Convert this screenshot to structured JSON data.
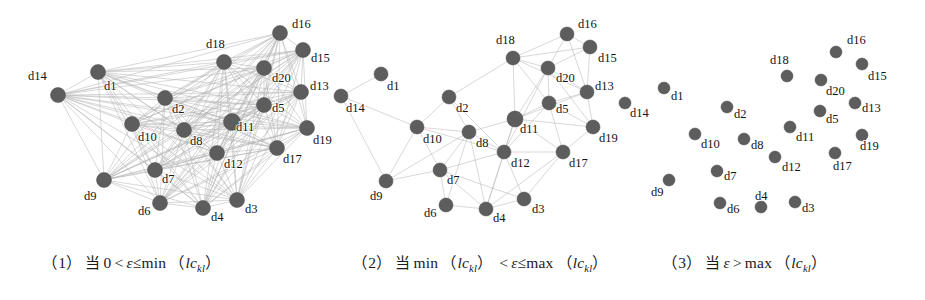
{
  "figure": {
    "node_color": "#5d5d5d",
    "edge_color": "#b2b2b2",
    "background": "#ffffff",
    "node_labels": [
      "d1",
      "d2",
      "d3",
      "d4",
      "d5",
      "d6",
      "d7",
      "d8",
      "d9",
      "d10",
      "d11",
      "d12",
      "d13",
      "d14",
      "d15",
      "d16",
      "d17",
      "d18",
      "d19",
      "d20"
    ]
  },
  "panels": [
    {
      "id": "panel-1",
      "caption": {
        "index": "（1）",
        "cjk": "当",
        "expr_left": "0",
        "rel1": "<",
        "var": "ε",
        "rel2": "≤",
        "fn": "min",
        "arg_open": "（",
        "arg_base": "lc",
        "arg_sub": "kl",
        "arg_close": "）"
      },
      "density": "full",
      "nodes": [
        {
          "label": "d14",
          "x": 58,
          "y": 95,
          "r": 7.5,
          "lx": 28,
          "ly": 80
        },
        {
          "label": "d1",
          "x": 98,
          "y": 72,
          "r": 7.5,
          "lx": 104,
          "ly": 90
        },
        {
          "label": "d18",
          "x": 224,
          "y": 62,
          "r": 7.5,
          "lx": 206,
          "ly": 48
        },
        {
          "label": "d16",
          "x": 280,
          "y": 33,
          "r": 7.5,
          "lx": 292,
          "ly": 28
        },
        {
          "label": "d15",
          "x": 303,
          "y": 50,
          "r": 7.5,
          "lx": 311,
          "ly": 62
        },
        {
          "label": "d20",
          "x": 264,
          "y": 68,
          "r": 7.5,
          "lx": 272,
          "ly": 82
        },
        {
          "label": "d13",
          "x": 301,
          "y": 92,
          "r": 7.5,
          "lx": 310,
          "ly": 90
        },
        {
          "label": "d2",
          "x": 165,
          "y": 98,
          "r": 7.5,
          "lx": 172,
          "ly": 113
        },
        {
          "label": "d5",
          "x": 264,
          "y": 105,
          "r": 7.5,
          "lx": 272,
          "ly": 112
        },
        {
          "label": "d19",
          "x": 307,
          "y": 128,
          "r": 7.5,
          "lx": 313,
          "ly": 144
        },
        {
          "label": "d10",
          "x": 132,
          "y": 124,
          "r": 7.5,
          "lx": 138,
          "ly": 141
        },
        {
          "label": "d8",
          "x": 184,
          "y": 130,
          "r": 7.5,
          "lx": 190,
          "ly": 145
        },
        {
          "label": "d11",
          "x": 232,
          "y": 122,
          "r": 8.5,
          "lx": 236,
          "ly": 131
        },
        {
          "label": "d12",
          "x": 217,
          "y": 153,
          "r": 7.5,
          "lx": 224,
          "ly": 168
        },
        {
          "label": "d17",
          "x": 277,
          "y": 148,
          "r": 7.5,
          "lx": 283,
          "ly": 163
        },
        {
          "label": "d7",
          "x": 155,
          "y": 170,
          "r": 7.5,
          "lx": 162,
          "ly": 183
        },
        {
          "label": "d9",
          "x": 104,
          "y": 180,
          "r": 7.5,
          "lx": 84,
          "ly": 200
        },
        {
          "label": "d6",
          "x": 160,
          "y": 203,
          "r": 7.5,
          "lx": 138,
          "ly": 215
        },
        {
          "label": "d4",
          "x": 203,
          "y": 208,
          "r": 7.5,
          "lx": 211,
          "ly": 221
        },
        {
          "label": "d3",
          "x": 237,
          "y": 200,
          "r": 7.5,
          "lx": 245,
          "ly": 213
        }
      ]
    },
    {
      "id": "panel-2",
      "caption": {
        "index": "（2）",
        "cjk": "当",
        "fn1": "min",
        "arg1_open": "（",
        "arg1_base": "lc",
        "arg1_sub": "kl",
        "arg1_close": "）",
        "rel1": "<",
        "var": "ε",
        "rel2": "≤",
        "fn2": "max",
        "arg2_open": "（",
        "arg2_base": "lc",
        "arg2_sub": "kl",
        "arg2_close": "）"
      },
      "density": "sparse",
      "nodes": [
        {
          "label": "d14",
          "x": 11,
          "y": 96,
          "r": 7,
          "lx": 16,
          "ly": 112
        },
        {
          "label": "d1",
          "x": 51,
          "y": 74,
          "r": 7,
          "lx": 57,
          "ly": 90
        },
        {
          "label": "d18",
          "x": 183,
          "y": 58,
          "r": 7,
          "lx": 166,
          "ly": 44
        },
        {
          "label": "d16",
          "x": 237,
          "y": 34,
          "r": 7,
          "lx": 248,
          "ly": 28
        },
        {
          "label": "d15",
          "x": 260,
          "y": 47,
          "r": 7,
          "lx": 268,
          "ly": 62
        },
        {
          "label": "d20",
          "x": 218,
          "y": 68,
          "r": 7,
          "lx": 226,
          "ly": 82
        },
        {
          "label": "d13",
          "x": 257,
          "y": 92,
          "r": 7,
          "lx": 265,
          "ly": 90
        },
        {
          "label": "d2",
          "x": 119,
          "y": 97,
          "r": 7,
          "lx": 126,
          "ly": 112
        },
        {
          "label": "d5",
          "x": 219,
          "y": 103,
          "r": 7,
          "lx": 226,
          "ly": 113
        },
        {
          "label": "d19",
          "x": 263,
          "y": 127,
          "r": 7,
          "lx": 269,
          "ly": 142
        },
        {
          "label": "d10",
          "x": 87,
          "y": 127,
          "r": 7,
          "lx": 93,
          "ly": 143
        },
        {
          "label": "d8",
          "x": 139,
          "y": 132,
          "r": 7,
          "lx": 146,
          "ly": 147
        },
        {
          "label": "d11",
          "x": 185,
          "y": 119,
          "r": 8,
          "lx": 190,
          "ly": 133
        },
        {
          "label": "d12",
          "x": 174,
          "y": 152,
          "r": 7,
          "lx": 181,
          "ly": 167
        },
        {
          "label": "d17",
          "x": 233,
          "y": 152,
          "r": 7,
          "lx": 239,
          "ly": 167
        },
        {
          "label": "d7",
          "x": 110,
          "y": 170,
          "r": 7,
          "lx": 117,
          "ly": 184
        },
        {
          "label": "d9",
          "x": 56,
          "y": 181,
          "r": 7,
          "lx": 40,
          "ly": 200
        },
        {
          "label": "d6",
          "x": 116,
          "y": 205,
          "r": 7,
          "lx": 94,
          "ly": 217
        },
        {
          "label": "d4",
          "x": 156,
          "y": 209,
          "r": 7,
          "lx": 163,
          "ly": 222
        },
        {
          "label": "d3",
          "x": 194,
          "y": 199,
          "r": 7,
          "lx": 202,
          "ly": 213
        }
      ]
    },
    {
      "id": "panel-3",
      "caption": {
        "index": "（3）",
        "cjk": "当",
        "var": "ε",
        "rel": ">",
        "fn": "max",
        "arg_open": "（",
        "arg_base": "lc",
        "arg_sub": "kl",
        "arg_close": "）"
      },
      "density": "none",
      "nodes": [
        {
          "label": "d14",
          "x": 5,
          "y": 103,
          "r": 6,
          "lx": 10,
          "ly": 117
        },
        {
          "label": "d1",
          "x": 44,
          "y": 88,
          "r": 6,
          "lx": 51,
          "ly": 100
        },
        {
          "label": "d18",
          "x": 167,
          "y": 76,
          "r": 6,
          "lx": 150,
          "ly": 64
        },
        {
          "label": "d16",
          "x": 216,
          "y": 52,
          "r": 6,
          "lx": 227,
          "ly": 44
        },
        {
          "label": "d15",
          "x": 242,
          "y": 64,
          "r": 6,
          "lx": 248,
          "ly": 80
        },
        {
          "label": "d20",
          "x": 201,
          "y": 80,
          "r": 6,
          "lx": 206,
          "ly": 95
        },
        {
          "label": "d13",
          "x": 235,
          "y": 103,
          "r": 6,
          "lx": 242,
          "ly": 112
        },
        {
          "label": "d2",
          "x": 107,
          "y": 107,
          "r": 6,
          "lx": 114,
          "ly": 118
        },
        {
          "label": "d5",
          "x": 200,
          "y": 111,
          "r": 6,
          "lx": 206,
          "ly": 123
        },
        {
          "label": "d19",
          "x": 242,
          "y": 135,
          "r": 6,
          "lx": 240,
          "ly": 150
        },
        {
          "label": "d10",
          "x": 75,
          "y": 134,
          "r": 6,
          "lx": 81,
          "ly": 148
        },
        {
          "label": "d8",
          "x": 124,
          "y": 139,
          "r": 6,
          "lx": 131,
          "ly": 149
        },
        {
          "label": "d11",
          "x": 170,
          "y": 127,
          "r": 6,
          "lx": 176,
          "ly": 141
        },
        {
          "label": "d12",
          "x": 155,
          "y": 157,
          "r": 6,
          "lx": 162,
          "ly": 171
        },
        {
          "label": "d17",
          "x": 215,
          "y": 153,
          "r": 6,
          "lx": 213,
          "ly": 170
        },
        {
          "label": "d7",
          "x": 97,
          "y": 171,
          "r": 6,
          "lx": 104,
          "ly": 180
        },
        {
          "label": "d9",
          "x": 49,
          "y": 180,
          "r": 6,
          "lx": 31,
          "ly": 196
        },
        {
          "label": "d6",
          "x": 100,
          "y": 203,
          "r": 6,
          "lx": 107,
          "ly": 213
        },
        {
          "label": "d4",
          "x": 141,
          "y": 207,
          "r": 6,
          "lx": 135,
          "ly": 200
        },
        {
          "label": "d3",
          "x": 175,
          "y": 202,
          "r": 6,
          "lx": 182,
          "ly": 212
        }
      ]
    }
  ]
}
